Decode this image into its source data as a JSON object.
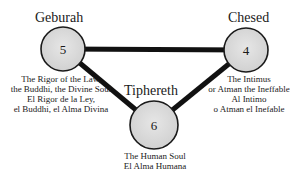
{
  "diagram": {
    "colors": {
      "node_fill": "#d9d9d9",
      "node_stroke": "#1a1a1a",
      "edge": "#111111",
      "background": "#ffffff"
    },
    "nodes": [
      {
        "id": "geburah",
        "title": "Geburah",
        "number": "5",
        "description": [
          "The Rigor of the Law,",
          "the Buddhi, the Divine Soul",
          "El Rigor de la Ley,",
          "el Buddhi, el Alma Divina"
        ]
      },
      {
        "id": "chesed",
        "title": "Chesed",
        "number": "4",
        "description": [
          "The Intimus",
          "or Atman the Ineffable",
          "Al Intimo",
          "o Atman el Inefable"
        ]
      },
      {
        "id": "tiphereth",
        "title": "Tiphereth",
        "number": "6",
        "description": [
          "The Human Soul",
          "El Alma Humana"
        ]
      }
    ],
    "edges": [
      {
        "from": "geburah",
        "to": "chesed"
      },
      {
        "from": "geburah",
        "to": "tiphereth"
      },
      {
        "from": "chesed",
        "to": "tiphereth"
      }
    ]
  }
}
